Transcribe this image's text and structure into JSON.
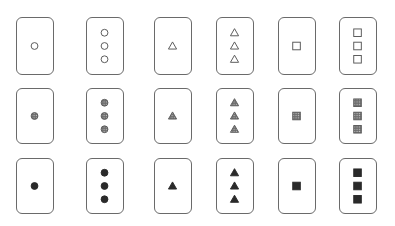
{
  "columns_x": [
    16,
    86,
    154,
    216,
    278,
    339
  ],
  "rows": [
    {
      "top": 17,
      "height": 58,
      "fill": "open"
    },
    {
      "top": 88,
      "height": 56,
      "fill": "dotted"
    },
    {
      "top": 158,
      "height": 56,
      "fill": "solid"
    }
  ],
  "cards": [
    {
      "row": 0,
      "col": 0,
      "shape": "circle",
      "count": 1,
      "fill": "open"
    },
    {
      "row": 0,
      "col": 1,
      "shape": "circle",
      "count": 3,
      "fill": "open"
    },
    {
      "row": 0,
      "col": 2,
      "shape": "triangle",
      "count": 1,
      "fill": "open"
    },
    {
      "row": 0,
      "col": 3,
      "shape": "triangle",
      "count": 3,
      "fill": "open"
    },
    {
      "row": 0,
      "col": 4,
      "shape": "square",
      "count": 1,
      "fill": "open"
    },
    {
      "row": 0,
      "col": 5,
      "shape": "square",
      "count": 3,
      "fill": "open"
    },
    {
      "row": 1,
      "col": 0,
      "shape": "circle",
      "count": 1,
      "fill": "dotted"
    },
    {
      "row": 1,
      "col": 1,
      "shape": "circle",
      "count": 3,
      "fill": "dotted"
    },
    {
      "row": 1,
      "col": 2,
      "shape": "triangle",
      "count": 1,
      "fill": "dotted"
    },
    {
      "row": 1,
      "col": 3,
      "shape": "triangle",
      "count": 3,
      "fill": "dotted"
    },
    {
      "row": 1,
      "col": 4,
      "shape": "square",
      "count": 1,
      "fill": "dotted"
    },
    {
      "row": 1,
      "col": 5,
      "shape": "square",
      "count": 3,
      "fill": "dotted"
    },
    {
      "row": 2,
      "col": 0,
      "shape": "circle",
      "count": 1,
      "fill": "solid"
    },
    {
      "row": 2,
      "col": 1,
      "shape": "circle",
      "count": 3,
      "fill": "solid"
    },
    {
      "row": 2,
      "col": 2,
      "shape": "triangle",
      "count": 1,
      "fill": "solid"
    },
    {
      "row": 2,
      "col": 3,
      "shape": "triangle",
      "count": 3,
      "fill": "solid"
    },
    {
      "row": 2,
      "col": 4,
      "shape": "square",
      "count": 1,
      "fill": "solid"
    },
    {
      "row": 2,
      "col": 5,
      "shape": "square",
      "count": 3,
      "fill": "solid"
    }
  ],
  "colors": {
    "border": "#6a6a6a",
    "stroke": "#555555",
    "solid": "#2a2a2a",
    "dotted_bg": "#8a8a8a",
    "dotted_dot": "#dddddd"
  }
}
